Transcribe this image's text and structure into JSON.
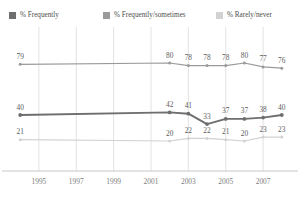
{
  "title": {
    "text": "",
    "visible_fragment": ""
  },
  "legend": {
    "position": "top",
    "items": [
      {
        "label": "% Frequently",
        "color": "#6e6e6e",
        "swatch": "legend-swatch-frequently"
      },
      {
        "label": "% Frequently/sometimes",
        "color": "#9a9a9a",
        "swatch": "legend-swatch-frequently-sometimes"
      },
      {
        "label": "% Rarely/never",
        "color": "#d2d2d2",
        "swatch": "legend-swatch-rarely-never"
      }
    ]
  },
  "chart_data": {
    "type": "line",
    "title": "",
    "xlabel": "",
    "ylabel": "",
    "x": [
      1994,
      2002,
      2003,
      2004,
      2005,
      2006,
      2007,
      2008
    ],
    "tick_labels": [
      "1995",
      "1997",
      "1999",
      "2001",
      "2003",
      "2005",
      "2007"
    ],
    "tick_values": [
      1995,
      1997,
      1999,
      2001,
      2003,
      2005,
      2007
    ],
    "xlim": [
      1993.4,
      2008.6
    ],
    "ylim": [
      0,
      100
    ],
    "grid": "vertical",
    "legend_position": "top",
    "series": [
      {
        "name": "% Frequently/sometimes",
        "color": "#9a9a9a",
        "values": [
          79,
          80,
          78,
          78,
          78,
          80,
          77,
          76
        ],
        "labels": [
          "79",
          "80",
          "78",
          "78",
          "78",
          "80",
          "77",
          "76"
        ]
      },
      {
        "name": "% Frequently",
        "color": "#6e6e6e",
        "values": [
          40,
          42,
          41,
          33,
          37,
          37,
          38,
          40
        ],
        "labels": [
          "40",
          "42",
          "41",
          "33",
          "37",
          "37",
          "38",
          "40"
        ]
      },
      {
        "name": "% Rarely/never",
        "color": "#d2d2d2",
        "values": [
          21,
          20,
          22,
          22,
          21,
          20,
          23,
          23
        ],
        "labels": [
          "21",
          "20",
          "22",
          "22",
          "21",
          "20",
          "23",
          "23"
        ]
      }
    ]
  },
  "colors": {
    "frequently": "#6e6e6e",
    "frequently_sometimes": "#9a9a9a",
    "rarely_never": "#d2d2d2",
    "gridline": "#e2e2e2",
    "axis": "#c8c8c8",
    "text": "#5d5d5d"
  }
}
